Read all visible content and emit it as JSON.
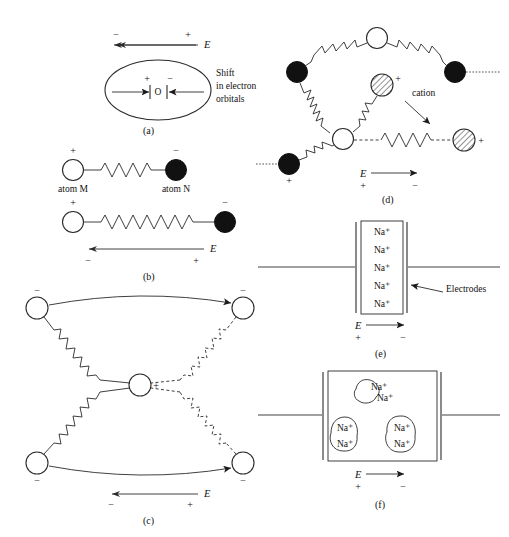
{
  "figure": {
    "title_semantic": "polarization-mechanisms-diagram",
    "background_color": "#ffffff",
    "ink_color": "#2a2a2a"
  },
  "panels": [
    {
      "id": "a",
      "caption": "(a)",
      "description": "electronic polarization of an atom",
      "efield_label": "E",
      "efield_direction": "left",
      "efield_left_sign": "−",
      "efield_right_sign": "+",
      "nucleus_label": "O",
      "inner_left_sign": "+",
      "inner_right_sign": "−",
      "annotation_lines": [
        "Shift",
        "in electron",
        "orbitals"
      ]
    },
    {
      "id": "b",
      "caption": "(b)",
      "description": "ionic polarization of an atom pair joined by a spring bond",
      "row1": {
        "left_atom_label": "atom M",
        "left_atom_sign": "+",
        "right_atom_label": "atom N",
        "right_atom_sign": "−",
        "spring_state": "relaxed"
      },
      "row2": {
        "left_atom_sign": "+",
        "right_atom_sign": "−",
        "spring_state": "stretched",
        "efield_label": "E",
        "efield_direction": "left",
        "efield_left_sign": "−",
        "efield_right_sign": "+"
      }
    },
    {
      "id": "c",
      "caption": "(c)",
      "description": "dipolar polarization: central cation displaced within a cage of four anions",
      "center_sign": "+",
      "corner_signs": [
        "−",
        "−",
        "−",
        "−"
      ],
      "efield_label": "E",
      "efield_direction": "left",
      "efield_left_sign": "−",
      "efield_right_sign": "+"
    },
    {
      "id": "d",
      "description": "space charge / cation hopping in a network",
      "caption": "(d)",
      "cation_label": "cation",
      "cation_sign": "+",
      "displaced_cation_sign": "+",
      "bottom_left_sign": "+",
      "efield_label": "E",
      "efield_direction": "right",
      "efield_left_sign": "+",
      "efield_right_sign": "−"
    },
    {
      "id": "e",
      "caption": "(e)",
      "description": "sodium ions uniformly distributed between electrodes",
      "ion_label": "Na⁺",
      "ion_count": 5,
      "electrodes_label": "Electrodes",
      "efield_label": "E",
      "efield_direction": "right",
      "efield_left_sign": "+",
      "efield_right_sign": "−"
    },
    {
      "id": "f",
      "caption": "(f)",
      "description": "sodium ions clustered into space-charge pockets between electrodes",
      "ion_label": "Na⁺",
      "clusters": [
        {
          "position": "top-center",
          "ions": [
            "Na⁺",
            "Na⁺"
          ]
        },
        {
          "position": "bottom-left",
          "ions": [
            "Na⁺",
            "Na⁺"
          ]
        },
        {
          "position": "bottom-right",
          "ions": [
            "Na⁺",
            "Na⁺"
          ]
        }
      ],
      "efield_label": "E",
      "efield_direction": "right",
      "efield_left_sign": "+",
      "efield_right_sign": "−"
    }
  ]
}
